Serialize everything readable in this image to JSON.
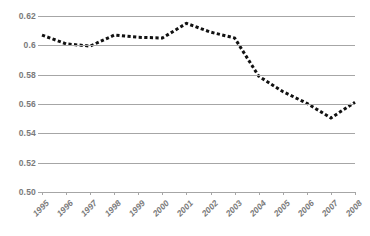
{
  "chart_data": {
    "type": "line",
    "title": "",
    "subtitle": "",
    "xlabel": "",
    "ylabel": "",
    "categories": [
      "1995",
      "1996",
      "1997",
      "1998",
      "1999",
      "2000",
      "2001",
      "2002",
      "2003",
      "2004",
      "2005",
      "2006",
      "2007",
      "2008"
    ],
    "series": [
      {
        "name": "",
        "values": [
          0.607,
          0.601,
          0.5995,
          0.607,
          0.6055,
          0.605,
          0.615,
          0.609,
          0.605,
          0.579,
          0.5685,
          0.5605,
          0.5505,
          0.5612
        ]
      }
    ],
    "ylim": [
      0.5,
      0.62
    ],
    "yticks": [
      0.62,
      0.6,
      0.58,
      0.56,
      0.54,
      0.52,
      0.5
    ],
    "ytick_labels": [
      "0.62",
      "0.6",
      "0.58",
      "0.56",
      "0.54",
      "0.52",
      "0.50"
    ],
    "grid": "horizontal",
    "legend": "none",
    "line_style": "dashed",
    "marker": "none",
    "colors": {
      "line": "#111111",
      "grid": "#a6a6a6",
      "axis": "#a6a6a6",
      "tick_text": "#7a7a7a",
      "background": "#ffffff"
    }
  }
}
